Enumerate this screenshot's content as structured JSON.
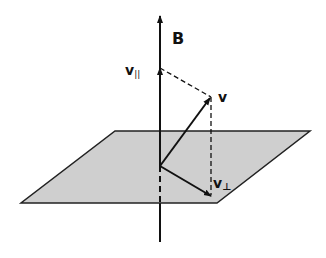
{
  "diagram": {
    "labels": {
      "field": "B",
      "velocity": "v",
      "parallel_main": "v",
      "parallel_sub": "||",
      "perp_main": "v",
      "perp_sub": "⊥"
    },
    "colors": {
      "plane_fill": "#cfcfcf",
      "line": "#111111",
      "background": "#ffffff"
    }
  }
}
